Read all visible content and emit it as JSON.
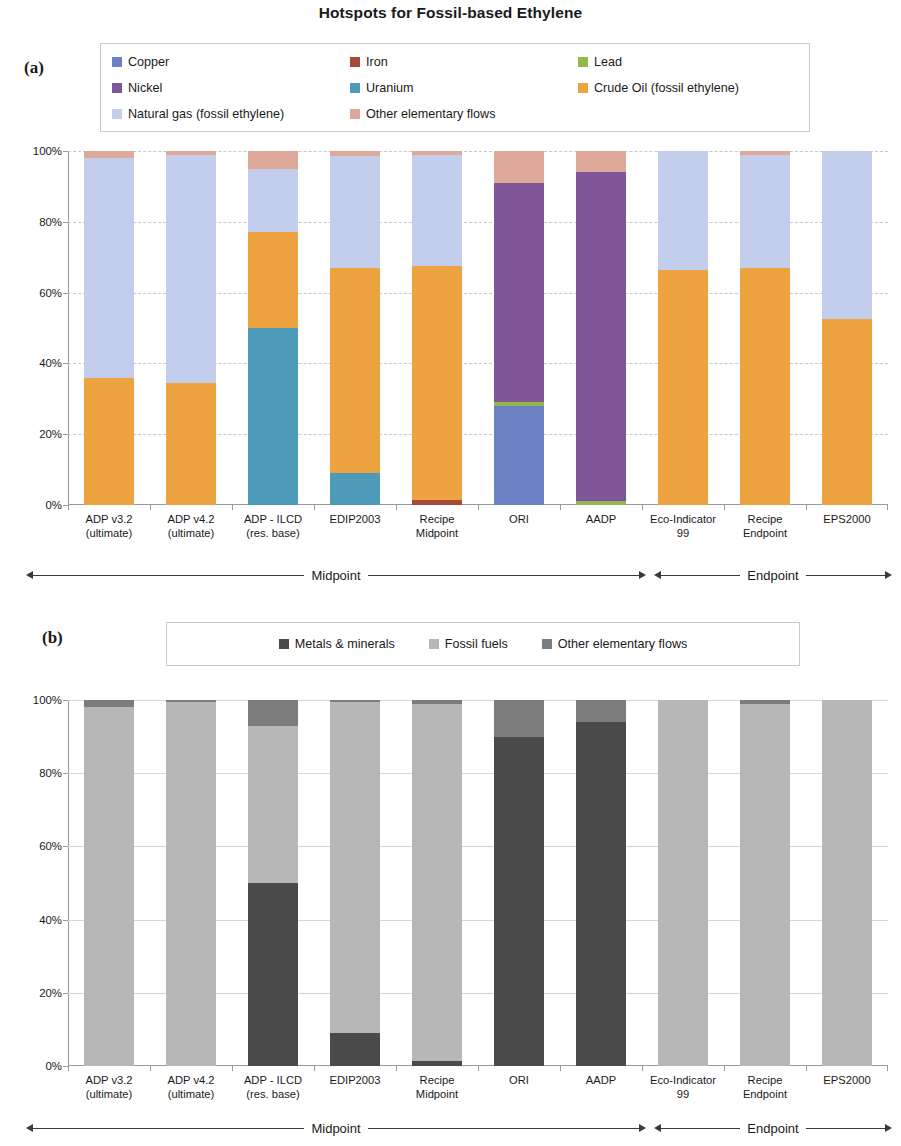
{
  "title": "Hotspots for Fossil-based Ethylene",
  "panels": {
    "a": {
      "letter": "(a)"
    },
    "b": {
      "letter": "(b)"
    }
  },
  "legend_a": [
    {
      "label": "Copper",
      "color": "#6b82c4"
    },
    {
      "label": "Iron",
      "color": "#a8493a"
    },
    {
      "label": "Lead",
      "color": "#93b84b"
    },
    {
      "label": "Nickel",
      "color": "#7e5699"
    },
    {
      "label": "Uranium",
      "color": "#4e9bb9"
    },
    {
      "label": "Crude Oil (fossil ethylene)",
      "color": "#eda340"
    },
    {
      "label": "Natural gas (fossil ethylene)",
      "color": "#c3cdec"
    },
    {
      "label": "Other elementary flows",
      "color": "#dfa99a"
    }
  ],
  "legend_b": [
    {
      "label": "Metals & minerals",
      "color": "#4a4a4a"
    },
    {
      "label": "Fossil fuels",
      "color": "#b7b7b7"
    },
    {
      "label": "Other elementary flows",
      "color": "#7d7d7d"
    }
  ],
  "axis": {
    "ticks": [
      "100%",
      "80%",
      "60%",
      "40%",
      "20%",
      "0%"
    ],
    "tick_values": [
      100,
      80,
      60,
      40,
      20,
      0
    ],
    "ylim": [
      0,
      100
    ]
  },
  "categories": [
    "ADP v3.2\n(ultimate)",
    "ADP v4.2\n(ultimate)",
    "ADP - ILCD\n(res. base)",
    "EDIP2003",
    "Recipe\nMidpoint",
    "ORI",
    "AADP",
    "Eco-Indicator\n99",
    "Recipe\nEndpoint",
    "EPS2000"
  ],
  "ranges": {
    "midpoint": "Midpoint",
    "endpoint": "Endpoint"
  },
  "chart_data": [
    {
      "type": "bar",
      "subtype": "stacked-100-percent",
      "panel": "(a)",
      "title": "Hotspots for Fossil-based Ethylene",
      "xlabel": "",
      "ylabel": "",
      "ylim": [
        0,
        100
      ],
      "grid": true,
      "legend_position": "top",
      "categories": [
        "ADP v3.2 (ultimate)",
        "ADP v4.2 (ultimate)",
        "ADP - ILCD (res. base)",
        "EDIP2003",
        "Recipe Midpoint",
        "ORI",
        "AADP",
        "Eco-Indicator 99",
        "Recipe Endpoint",
        "EPS2000"
      ],
      "series": [
        {
          "name": "Copper",
          "color": "#6b82c4",
          "values": [
            0,
            0,
            0,
            0,
            0,
            28,
            0,
            0,
            0,
            0
          ]
        },
        {
          "name": "Iron",
          "color": "#a8493a",
          "values": [
            0,
            0,
            0,
            0,
            1.5,
            0,
            0,
            0,
            0,
            0
          ]
        },
        {
          "name": "Lead",
          "color": "#93b84b",
          "values": [
            0,
            0,
            0,
            0,
            0,
            1,
            1.2,
            0,
            0,
            0
          ]
        },
        {
          "name": "Nickel",
          "color": "#7e5699",
          "values": [
            0,
            0,
            0,
            0,
            0,
            62,
            93,
            0,
            0,
            0
          ]
        },
        {
          "name": "Uranium",
          "color": "#4e9bb9",
          "values": [
            0,
            0,
            50,
            9,
            0,
            0,
            0,
            0,
            0,
            0
          ]
        },
        {
          "name": "Crude Oil (fossil ethylene)",
          "color": "#eda340",
          "values": [
            36,
            34.5,
            27,
            58,
            66,
            0,
            0,
            66.5,
            67,
            52.5
          ]
        },
        {
          "name": "Natural gas (fossil ethylene)",
          "color": "#c3cdec",
          "values": [
            62,
            64.5,
            18,
            31.5,
            31.5,
            0,
            0,
            33.5,
            32,
            47.5
          ]
        },
        {
          "name": "Other elementary flows",
          "color": "#dfa99a",
          "values": [
            2,
            1,
            5,
            1.5,
            1,
            9,
            5.8,
            0,
            1,
            0
          ]
        }
      ]
    },
    {
      "type": "bar",
      "subtype": "stacked-100-percent",
      "panel": "(b)",
      "title": "",
      "xlabel": "",
      "ylabel": "",
      "ylim": [
        0,
        100
      ],
      "grid": true,
      "legend_position": "top",
      "categories": [
        "ADP v3.2 (ultimate)",
        "ADP v4.2 (ultimate)",
        "ADP - ILCD (res. base)",
        "EDIP2003",
        "Recipe Midpoint",
        "ORI",
        "AADP",
        "Eco-Indicator 99",
        "Recipe Endpoint",
        "EPS2000"
      ],
      "series": [
        {
          "name": "Metals & minerals",
          "color": "#4a4a4a",
          "values": [
            0,
            0,
            50,
            9,
            1.5,
            90,
            94,
            0,
            0,
            0
          ]
        },
        {
          "name": "Fossil fuels",
          "color": "#b7b7b7",
          "values": [
            98,
            99.5,
            43,
            90.5,
            97.5,
            0,
            0,
            100,
            99,
            100
          ]
        },
        {
          "name": "Other elementary flows",
          "color": "#7d7d7d",
          "values": [
            2,
            0.5,
            7,
            0.5,
            1,
            10,
            6,
            0,
            1,
            0
          ]
        }
      ]
    }
  ]
}
